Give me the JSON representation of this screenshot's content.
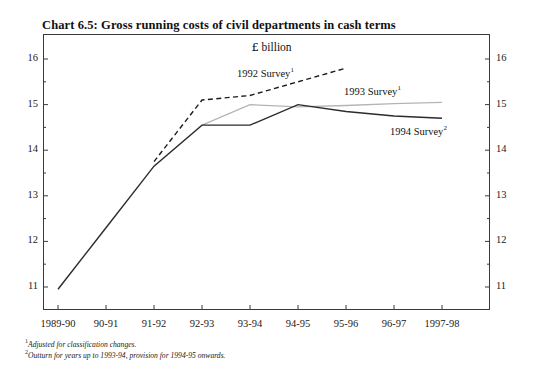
{
  "title": "Chart 6.5: Gross running costs of civil departments in cash terms",
  "units_prefix": "£",
  "units_text": " billion",
  "footnotes": [
    {
      "marker": "1",
      "text": "Adjusted for classification changes."
    },
    {
      "marker": "2",
      "text": "Outturn for years up to 1993-94, provision for 1994-95 onwards."
    }
  ],
  "series_labels": [
    {
      "name": "1992 Survey",
      "marker": "1"
    },
    {
      "name": "1993 Survey",
      "marker": "1"
    },
    {
      "name": "1994 Survey",
      "marker": "2"
    }
  ],
  "colors": {
    "axis": "#3a3a3a",
    "series_1992": "#1c1c1c",
    "series_1993": "#b4b4b4",
    "series_1994": "#2b2b2b",
    "text": "#1a1a1a"
  },
  "chart_data": {
    "type": "line",
    "title": "Chart 6.5: Gross running costs of civil departments in cash terms",
    "subtitle": "£ billion",
    "xlabel": "",
    "ylabel": "£ billion",
    "ylim": [
      10.5,
      16.2
    ],
    "yticks": [
      11,
      12,
      13,
      14,
      15,
      16
    ],
    "yticks_minor": [
      11.5,
      12.5,
      13.5,
      14.5,
      15.5
    ],
    "grid": false,
    "legend": "inline-annotations",
    "categories": [
      "1989-90",
      "90-91",
      "91-92",
      "92-93",
      "93-94",
      "94-95",
      "95-96",
      "96-97",
      "1997-98"
    ],
    "series": [
      {
        "name": "1992 Survey",
        "style": "dashed",
        "color": "#1c1c1c",
        "x": [
          "91-92",
          "92-93",
          "93-94",
          "94-95",
          "95-96"
        ],
        "values": [
          13.75,
          15.1,
          15.2,
          15.5,
          15.8
        ]
      },
      {
        "name": "1993 Survey",
        "style": "solid-light",
        "color": "#b4b4b4",
        "x": [
          "92-93",
          "93-94",
          "94-95",
          "95-96",
          "96-97",
          "1997-98"
        ],
        "values": [
          14.55,
          15.0,
          14.95,
          14.98,
          15.02,
          15.05
        ]
      },
      {
        "name": "1994 Survey",
        "style": "solid",
        "color": "#2b2b2b",
        "x": [
          "1989-90",
          "90-91",
          "91-92",
          "92-93",
          "93-94",
          "94-95",
          "95-96",
          "96-97",
          "1997-98"
        ],
        "values": [
          10.95,
          12.3,
          13.65,
          14.55,
          14.55,
          15.0,
          14.85,
          14.75,
          14.7
        ]
      }
    ]
  }
}
